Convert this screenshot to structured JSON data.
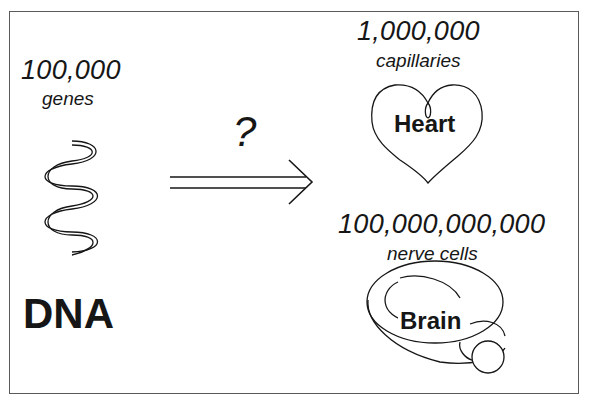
{
  "diagram": {
    "left": {
      "count": "100,000",
      "unit": "genes",
      "label": "DNA",
      "icon": "dna-helix-icon"
    },
    "middle": {
      "question": "?",
      "icon": "double-arrow-right-icon"
    },
    "right_top": {
      "count": "1,000,000",
      "unit": "capillaries",
      "label": "Heart",
      "icon": "heart-outline-icon"
    },
    "right_bottom": {
      "count": "100,000,000,000",
      "unit": "nerve cells",
      "label": "Brain",
      "icon": "brain-outline-icon"
    },
    "colors": {
      "ink": "#161616",
      "frame": "#5a5a5a",
      "background": "#ffffff"
    }
  }
}
